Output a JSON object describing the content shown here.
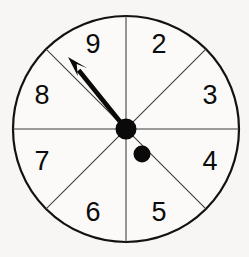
{
  "figure": {
    "kind": "spinner-wheel",
    "background_color": "#f7f6f4",
    "ink_color": "#0a0a0a",
    "face_color": "#fbfaf8",
    "divider_color": "#3a3a3a"
  },
  "wheel": {
    "center_x": 126,
    "center_y": 129,
    "radius": 113,
    "sector_count": 8,
    "sector_angle_degrees": 45,
    "label_radius": 86
  },
  "chart_data": {
    "type": "pie",
    "xlabel": "",
    "ylabel": "",
    "categories": [
      "2",
      "3",
      "4",
      "5",
      "6",
      "7",
      "8",
      "9"
    ],
    "values": [
      45,
      45,
      45,
      45,
      45,
      45,
      45,
      45
    ],
    "legend": "none",
    "grid": false,
    "annotations": [
      "arrow points to sector 9"
    ]
  },
  "sectors": [
    {
      "label": "9",
      "mid_angle_deg": -67.5,
      "label_x": 93,
      "label_y": 46
    },
    {
      "label": "2",
      "mid_angle_deg": -22.5,
      "label_x": 159,
      "label_y": 46
    },
    {
      "label": "3",
      "mid_angle_deg": 22.5,
      "label_x": 210,
      "label_y": 97
    },
    {
      "label": "4",
      "mid_angle_deg": 67.5,
      "label_x": 210,
      "label_y": 163
    },
    {
      "label": "5",
      "mid_angle_deg": 112.5,
      "label_x": 159,
      "label_y": 214
    },
    {
      "label": "6",
      "mid_angle_deg": 157.5,
      "label_x": 93,
      "label_y": 214
    },
    {
      "label": "7",
      "mid_angle_deg": 202.5,
      "label_x": 42,
      "label_y": 163
    },
    {
      "label": "8",
      "mid_angle_deg": 247.5,
      "label_x": 42,
      "label_y": 97
    }
  ],
  "dividers": [
    {
      "name": "vertical",
      "angle_deg": 0
    },
    {
      "name": "diagonal-ne",
      "angle_deg": 45
    },
    {
      "name": "horizontal",
      "angle_deg": 90
    },
    {
      "name": "diagonal-nw",
      "angle_deg": 135
    }
  ],
  "pointer": {
    "name": "spinner-arrow",
    "points_to": "9",
    "angle_deg": 238,
    "tip_x": 68,
    "tip_y": 57,
    "tail_x": 126,
    "tail_y": 129,
    "head_length": 21,
    "head_half_width": 8
  },
  "pivot": {
    "name": "center-pivot",
    "cx": 126,
    "cy": 129,
    "r": 10.5
  },
  "tail_marker": {
    "name": "pointer-tail-dot",
    "cx": 142,
    "cy": 154,
    "r": 8.5
  }
}
